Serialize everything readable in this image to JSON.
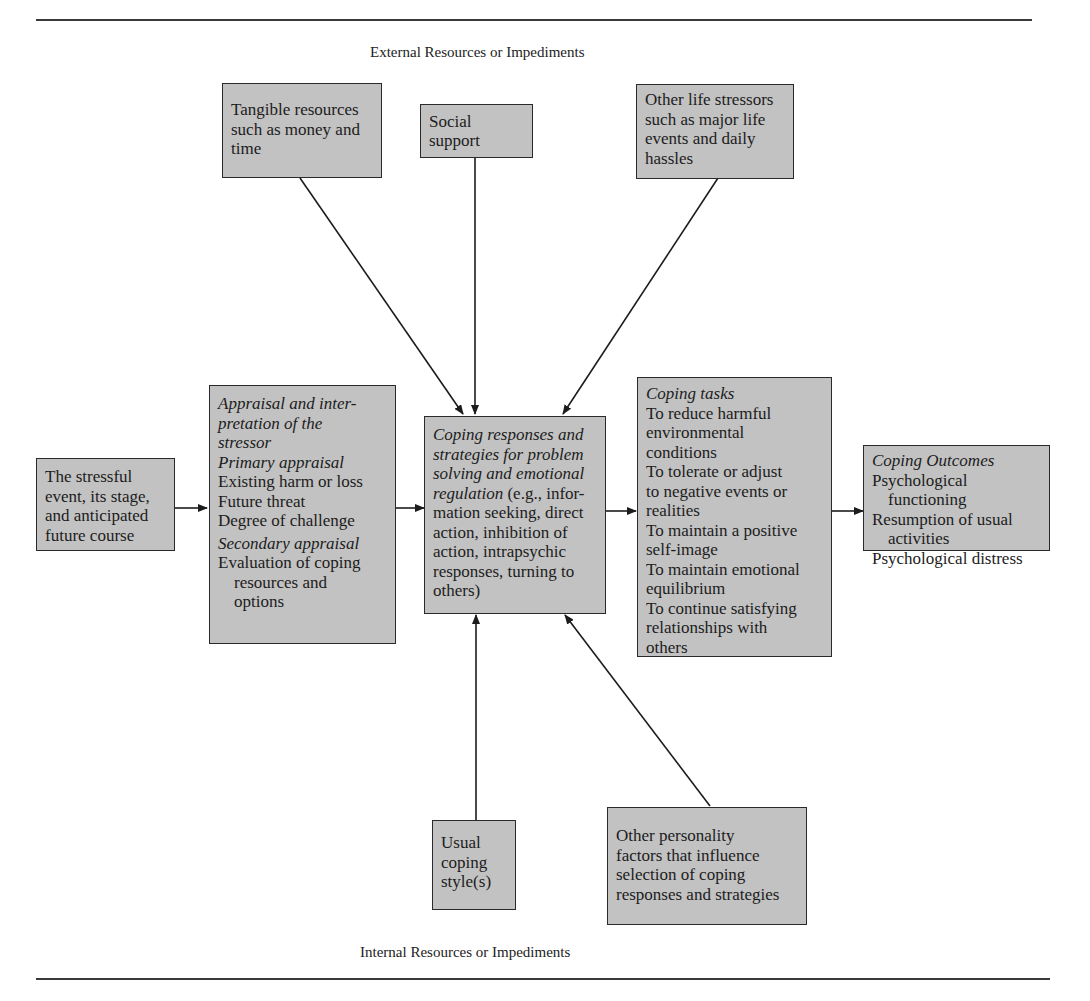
{
  "diagram": {
    "top_label": "External Resources or Impediments",
    "bottom_label": "Internal Resources or Impediments",
    "external": {
      "tangible": [
        "Tangible resources",
        "such as money and",
        "time"
      ],
      "social": "Social support",
      "stressors": [
        "Other life stressors",
        "such as major life",
        "events and daily",
        "hassles"
      ]
    },
    "stressful_event": [
      "The stressful",
      "event, its stage,",
      "and anticipated",
      "future course"
    ],
    "appraisal": {
      "heading": [
        "Appraisal and inter-",
        "pretation of the",
        "stressor"
      ],
      "primary_heading": "Primary appraisal",
      "primary_items": [
        "Existing harm or loss",
        "Future threat",
        "Degree of challenge"
      ],
      "secondary_heading": "Secondary appraisal",
      "secondary_line1": "Evaluation of coping",
      "secondary_indent": [
        "resources and",
        "options"
      ]
    },
    "coping_responses": {
      "italic_lines": [
        "Coping responses and",
        "strategies for problem",
        "solving and emotional"
      ],
      "italic_last": "regulation",
      "rest_first": " (e.g., infor-",
      "rest_lines": [
        "mation seeking, direct",
        "action, inhibition of",
        "action, intrapsychic",
        "responses, turning to",
        "others)"
      ]
    },
    "coping_tasks": {
      "heading": "Coping tasks",
      "lines": [
        "To reduce harmful",
        "environmental",
        "conditions",
        "To tolerate or adjust",
        "to negative events or",
        "realities",
        "To maintain a positive",
        "self-image",
        "To maintain emotional",
        "equilibrium",
        "To continue satisfying",
        "relationships with",
        "others"
      ]
    },
    "coping_outcomes": {
      "heading": "Coping Outcomes",
      "item1": "Psychological",
      "item1_indent": "functioning",
      "item2": "Resumption of usual",
      "item2_indent": "activities",
      "item3": "Psychological distress"
    },
    "internal": {
      "usual_style": [
        "Usual",
        "coping",
        "style(s)"
      ],
      "personality": [
        "Other personality",
        "factors that influence",
        "selection of coping",
        "responses and strategies"
      ]
    },
    "colors": {
      "box_fill": "#c2c2c2",
      "stroke": "#2a2a2a"
    }
  }
}
